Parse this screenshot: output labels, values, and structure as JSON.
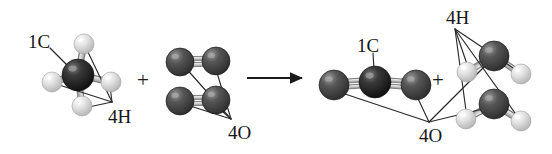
{
  "figure": {
    "kind": "chemical-reaction-diagram",
    "background_color": "#ffffff",
    "width": 552,
    "height": 154,
    "equation_text": "CH4 + 2O2 -> CO2 + 2H2O",
    "operators": {
      "plus_reactants": "+",
      "plus_products": "+",
      "arrow": "reaction-arrow"
    }
  },
  "colors": {
    "carbon": "#1d1d1d",
    "carbon_highlight": "#6e6e6e",
    "oxygen": "#3f3f3f",
    "oxygen_highlight": "#8c8c8c",
    "hydrogen": "#d8d8d8",
    "hydrogen_highlight": "#ffffff",
    "bond": "#b8b8b8",
    "bond_edge": "#6a6a6a",
    "leader_line": "#2a2a2a",
    "text": "#161616",
    "arrow": "#1a1a1a"
  },
  "labels": {
    "reactant_carbon": {
      "text": "1C",
      "x": 28,
      "y": 32
    },
    "reactant_hydrogen": {
      "text": "4H",
      "x": 108,
      "y": 107
    },
    "reactant_oxygen": {
      "text": "4O",
      "x": 228,
      "y": 123
    },
    "product_carbon": {
      "text": "1C",
      "x": 357,
      "y": 36
    },
    "product_hydrogen": {
      "text": "4H",
      "x": 446,
      "y": 8
    },
    "product_oxygen": {
      "text": "4O",
      "x": 419,
      "y": 126
    }
  },
  "operators_pos": {
    "plus_reactants": {
      "text": "+",
      "x": 137,
      "y": 70
    },
    "plus_products": {
      "text": "+",
      "x": 432,
      "y": 70
    }
  },
  "arrow": {
    "x1": 247,
    "y1": 78,
    "x2": 303,
    "y2": 78,
    "head_width": 11,
    "head_height": 8
  },
  "molecules": [
    {
      "name": "methane",
      "formula": "CH4",
      "side": "reactants",
      "atoms": [
        {
          "element": "C",
          "label": "carbon-center",
          "cx": 78,
          "cy": 75,
          "r": 16
        },
        {
          "element": "H",
          "label": "hydrogen-top",
          "cx": 84,
          "cy": 44,
          "r": 10
        },
        {
          "element": "H",
          "label": "hydrogen-left",
          "cx": 52,
          "cy": 82,
          "r": 10
        },
        {
          "element": "H",
          "label": "hydrogen-right",
          "cx": 111,
          "cy": 82,
          "r": 10
        },
        {
          "element": "H",
          "label": "hydrogen-bottom",
          "cx": 82,
          "cy": 106,
          "r": 10
        }
      ],
      "bonds": [
        {
          "from": 0,
          "to": 1,
          "order": 1
        },
        {
          "from": 0,
          "to": 2,
          "order": 1
        },
        {
          "from": 0,
          "to": 3,
          "order": 1
        },
        {
          "from": 0,
          "to": 4,
          "order": 1
        }
      ]
    },
    {
      "name": "dioxygen-upper",
      "formula": "O2",
      "side": "reactants",
      "atoms": [
        {
          "element": "O",
          "label": "oxygen-upper-left",
          "cx": 180,
          "cy": 62,
          "r": 14
        },
        {
          "element": "O",
          "label": "oxygen-upper-right",
          "cx": 216,
          "cy": 61,
          "r": 14
        }
      ],
      "bonds": [
        {
          "from": 0,
          "to": 1,
          "order": 2
        }
      ]
    },
    {
      "name": "dioxygen-lower",
      "formula": "O2",
      "side": "reactants",
      "atoms": [
        {
          "element": "O",
          "label": "oxygen-lower-left",
          "cx": 180,
          "cy": 101,
          "r": 14
        },
        {
          "element": "O",
          "label": "oxygen-lower-right",
          "cx": 216,
          "cy": 100,
          "r": 14
        }
      ],
      "bonds": [
        {
          "from": 0,
          "to": 1,
          "order": 2
        }
      ]
    },
    {
      "name": "carbon-dioxide",
      "formula": "CO2",
      "side": "products",
      "atoms": [
        {
          "element": "O",
          "label": "oxygen-left",
          "cx": 334,
          "cy": 85,
          "r": 15
        },
        {
          "element": "C",
          "label": "carbon-center",
          "cx": 375,
          "cy": 82,
          "r": 16
        },
        {
          "element": "O",
          "label": "oxygen-right",
          "cx": 416,
          "cy": 85,
          "r": 15
        }
      ],
      "bonds": [
        {
          "from": 0,
          "to": 1,
          "order": 2
        },
        {
          "from": 1,
          "to": 2,
          "order": 2
        }
      ]
    },
    {
      "name": "water-upper",
      "formula": "H2O",
      "side": "products",
      "atoms": [
        {
          "element": "O",
          "label": "oxygen-center",
          "cx": 494,
          "cy": 56,
          "r": 15
        },
        {
          "element": "H",
          "label": "hydrogen-left",
          "cx": 467,
          "cy": 72,
          "r": 10
        },
        {
          "element": "H",
          "label": "hydrogen-right",
          "cx": 521,
          "cy": 74,
          "r": 10
        }
      ],
      "bonds": [
        {
          "from": 0,
          "to": 1,
          "order": 1
        },
        {
          "from": 0,
          "to": 2,
          "order": 1
        }
      ]
    },
    {
      "name": "water-lower",
      "formula": "H2O",
      "side": "products",
      "atoms": [
        {
          "element": "O",
          "label": "oxygen-center",
          "cx": 494,
          "cy": 104,
          "r": 15
        },
        {
          "element": "H",
          "label": "hydrogen-left",
          "cx": 466,
          "cy": 119,
          "r": 10
        },
        {
          "element": "H",
          "label": "hydrogen-right",
          "cx": 521,
          "cy": 121,
          "r": 10
        }
      ],
      "bonds": [
        {
          "from": 0,
          "to": 1,
          "order": 1
        },
        {
          "from": 0,
          "to": 2,
          "order": 1
        }
      ]
    }
  ],
  "leaders": {
    "reactant_carbon": [
      {
        "x1": 50,
        "y1": 48,
        "x2": 72,
        "y2": 70
      }
    ],
    "reactant_hydrogen": [
      {
        "x1": 112,
        "y1": 102,
        "x2": 86,
        "y2": 48
      },
      {
        "x1": 112,
        "y1": 102,
        "x2": 56,
        "y2": 84
      },
      {
        "x1": 112,
        "y1": 102,
        "x2": 110,
        "y2": 86
      },
      {
        "x1": 112,
        "y1": 102,
        "x2": 84,
        "y2": 108
      }
    ],
    "reactant_oxygen": [
      {
        "x1": 231,
        "y1": 119,
        "x2": 184,
        "y2": 66
      },
      {
        "x1": 231,
        "y1": 119,
        "x2": 215,
        "y2": 66
      },
      {
        "x1": 231,
        "y1": 119,
        "x2": 184,
        "y2": 104
      },
      {
        "x1": 231,
        "y1": 119,
        "x2": 214,
        "y2": 104
      }
    ],
    "product_carbon": [
      {
        "x1": 373,
        "y1": 53,
        "x2": 374,
        "y2": 70
      }
    ],
    "product_hydrogen": [
      {
        "x1": 455,
        "y1": 29,
        "x2": 469,
        "y2": 70
      },
      {
        "x1": 455,
        "y1": 29,
        "x2": 519,
        "y2": 72
      },
      {
        "x1": 455,
        "y1": 29,
        "x2": 467,
        "y2": 118
      },
      {
        "x1": 455,
        "y1": 29,
        "x2": 520,
        "y2": 120
      }
    ],
    "product_oxygen": [
      {
        "x1": 429,
        "y1": 122,
        "x2": 333,
        "y2": 90
      },
      {
        "x1": 429,
        "y1": 122,
        "x2": 414,
        "y2": 90
      },
      {
        "x1": 429,
        "y1": 122,
        "x2": 491,
        "y2": 60
      },
      {
        "x1": 429,
        "y1": 122,
        "x2": 491,
        "y2": 107
      }
    ]
  }
}
